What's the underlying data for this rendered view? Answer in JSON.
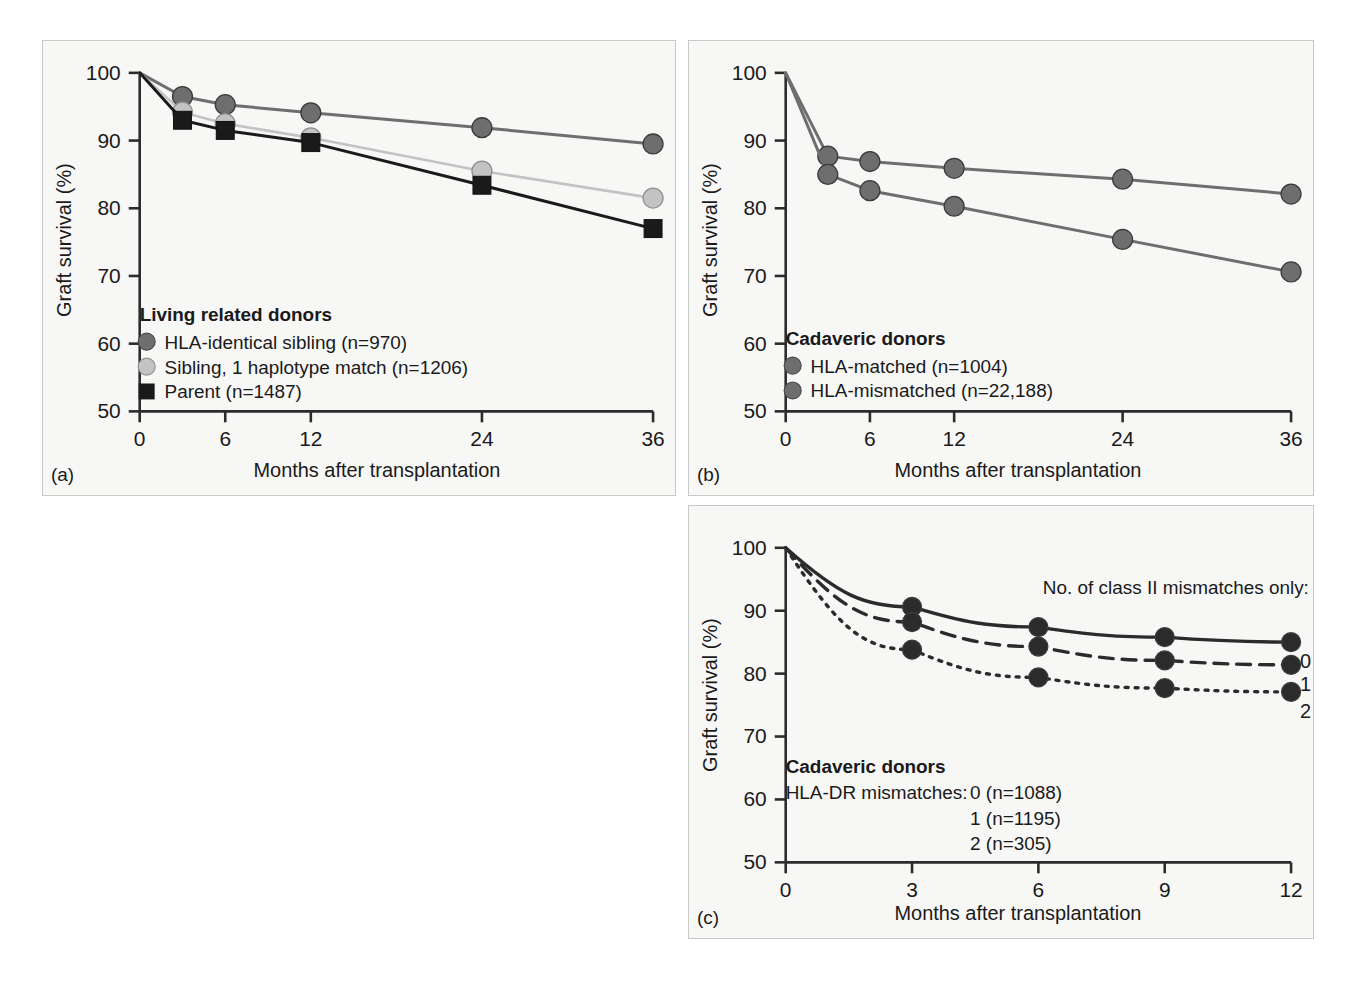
{
  "figure": {
    "background": "#ffffff",
    "panel_background": "#f7f7f6",
    "axis_color": "#2b2b2b",
    "colors": {
      "dark_gray": "#6e6e6e",
      "light_gray": "#c3c3c3",
      "black": "#1a1a1a",
      "panel_c_line": "#2b2b2b"
    }
  },
  "panel_a": {
    "letter": "(a)",
    "xlabel": "Months after transplantation",
    "ylabel": "Graft survival (%)",
    "legend_title": "Living related donors",
    "legend": [
      {
        "label": "HLA-identical sibling (n=970)",
        "marker": "circle",
        "color": "#6e6e6e"
      },
      {
        "label": "Sibling, 1 haplotype match (n=1206)",
        "marker": "circle",
        "color": "#c3c3c3"
      },
      {
        "label": "Parent (n=1487)",
        "marker": "square",
        "color": "#1a1a1a"
      }
    ]
  },
  "panel_b": {
    "letter": "(b)",
    "xlabel": "Months after transplantation",
    "ylabel": "Graft survival (%)",
    "legend_title": "Cadaveric donors",
    "legend": [
      {
        "label": "HLA-matched (n=1004)",
        "marker": "circle",
        "color": "#6e6e6e"
      },
      {
        "label": "HLA-mismatched (n=22,188)",
        "marker": "circle",
        "color": "#6e6e6e"
      }
    ]
  },
  "panel_c": {
    "letter": "(c)",
    "xlabel": "Months after transplantation",
    "ylabel": "Graft survival (%)",
    "legend_title": "Cadaveric donors",
    "legend_prefix": "HLA-DR mismatches:",
    "legend": [
      {
        "label": "0 (n=1088)"
      },
      {
        "label": "1 (n=1195)"
      },
      {
        "label": "2 (n=305)"
      }
    ],
    "annotation": "No. of class II mismatches only:",
    "curve_labels": [
      "0",
      "1",
      "2"
    ]
  },
  "chart_data": [
    {
      "id": "panel-a",
      "type": "line",
      "title": "",
      "xlabel": "Months after transplantation",
      "ylabel": "Graft survival (%)",
      "xlim": [
        0,
        36
      ],
      "ylim": [
        50,
        100
      ],
      "xticks": [
        0,
        6,
        12,
        24,
        36
      ],
      "yticks": [
        50,
        60,
        70,
        80,
        90,
        100
      ],
      "grid": false,
      "legend_position": "lower-left",
      "x": [
        0,
        3,
        6,
        12,
        24,
        36
      ],
      "series": [
        {
          "name": "HLA-identical sibling (n=970)",
          "color": "#6e6e6e",
          "marker": "circle",
          "values": [
            100,
            96.5,
            95.3,
            94.1,
            91.9,
            89.5
          ]
        },
        {
          "name": "Sibling, 1 haplotype match (n=1206)",
          "color": "#c3c3c3",
          "marker": "circle",
          "values": [
            100,
            94.2,
            92.5,
            90.4,
            85.5,
            81.5
          ]
        },
        {
          "name": "Parent (n=1487)",
          "color": "#1a1a1a",
          "marker": "square",
          "values": [
            100,
            93.0,
            91.5,
            89.7,
            83.4,
            77.0
          ]
        }
      ]
    },
    {
      "id": "panel-b",
      "type": "line",
      "title": "",
      "xlabel": "Months after transplantation",
      "ylabel": "Graft survival (%)",
      "xlim": [
        0,
        36
      ],
      "ylim": [
        50,
        100
      ],
      "xticks": [
        0,
        6,
        12,
        24,
        36
      ],
      "yticks": [
        50,
        60,
        70,
        80,
        90,
        100
      ],
      "grid": false,
      "legend_position": "lower-left",
      "x": [
        0,
        3,
        6,
        12,
        24,
        36
      ],
      "series": [
        {
          "name": "HLA-matched (n=1004)",
          "color": "#6e6e6e",
          "marker": "circle",
          "values": [
            100,
            87.7,
            86.9,
            85.9,
            84.3,
            82.1
          ]
        },
        {
          "name": "HLA-mismatched (n=22,188)",
          "color": "#6e6e6e",
          "marker": "circle",
          "values": [
            100,
            85.0,
            82.6,
            80.3,
            75.4,
            70.6
          ]
        }
      ]
    },
    {
      "id": "panel-c",
      "type": "line",
      "title": "",
      "xlabel": "Months after transplantation",
      "ylabel": "Graft survival (%)",
      "xlim": [
        0,
        12
      ],
      "ylim": [
        50,
        100
      ],
      "xticks": [
        0,
        3,
        6,
        9,
        12
      ],
      "yticks": [
        50,
        60,
        70,
        80,
        90,
        100
      ],
      "grid": false,
      "legend_position": "lower-left",
      "annotation": "No. of class II mismatches only:",
      "x": [
        0,
        3,
        6,
        9,
        12
      ],
      "series": [
        {
          "name": "0 (n=1088)",
          "color": "#2b2b2b",
          "linestyle": "solid",
          "marker": "circle",
          "end_label": "0",
          "values": [
            100,
            90.6,
            87.4,
            85.8,
            85.0
          ]
        },
        {
          "name": "1 (n=1195)",
          "color": "#2b2b2b",
          "linestyle": "dashed",
          "marker": "circle",
          "end_label": "1",
          "values": [
            100,
            88.2,
            84.3,
            82.1,
            81.4
          ]
        },
        {
          "name": "2 (n=305)",
          "color": "#2b2b2b",
          "linestyle": "dotted",
          "marker": "circle",
          "end_label": "2",
          "values": [
            100,
            83.8,
            79.4,
            77.7,
            77.1
          ]
        }
      ]
    }
  ]
}
